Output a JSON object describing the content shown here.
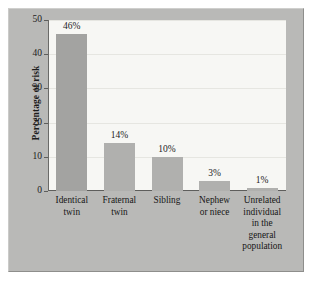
{
  "figure": {
    "panel_color": "#b9b9b7",
    "plot_background": "#f7f7f4",
    "axis_color": "#5e5e5c"
  },
  "chart_data": {
    "type": "bar",
    "title": "",
    "subtitle": "",
    "xlabel": "",
    "ylabel": "Percentage of risk",
    "ylim": [
      0,
      50
    ],
    "yticks": [
      0,
      10,
      20,
      30,
      40,
      50
    ],
    "ytick_labels": [
      "0",
      "10",
      "20",
      "30",
      "40",
      "50"
    ],
    "grid": true,
    "legend": false,
    "categories": [
      "Identical twin",
      "Fraternal twin",
      "Sibling",
      "Nephew or niece",
      "Unrelated individual in the general population"
    ],
    "category_lines": [
      [
        "Identical",
        "twin"
      ],
      [
        "Fraternal",
        "twin"
      ],
      [
        "Sibling"
      ],
      [
        "Nephew",
        "or niece"
      ],
      [
        "Unrelated",
        "individual",
        "in the",
        "general",
        "population"
      ]
    ],
    "values": [
      46,
      14,
      10,
      3,
      1
    ],
    "data_labels": [
      "46%",
      "14%",
      "10%",
      "3%",
      "1%"
    ],
    "bar_colors": [
      "#a3a3a1",
      "#b0b0ae",
      "#b0b0ae",
      "#b0b0ae",
      "#b0b0ae"
    ]
  }
}
